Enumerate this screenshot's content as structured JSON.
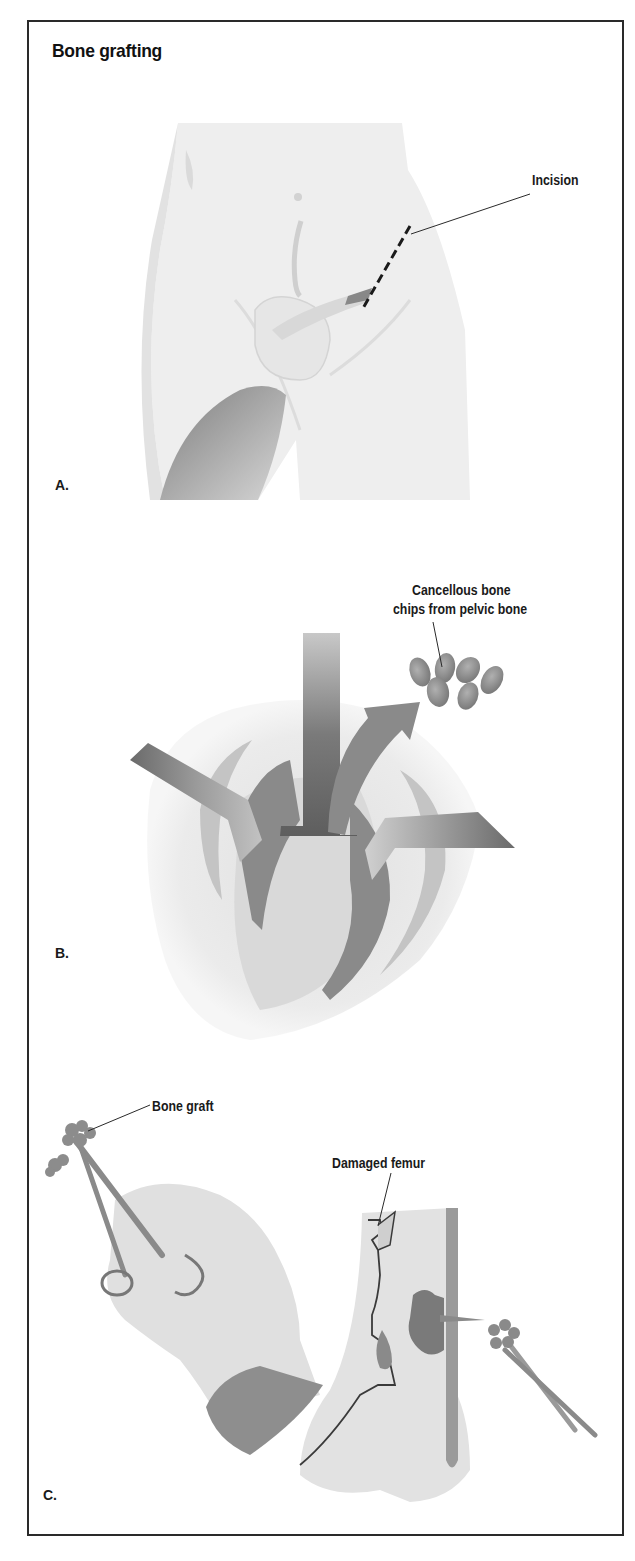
{
  "figure": {
    "title": "Bone grafting",
    "panels": [
      {
        "letter": "A.",
        "callouts": [
          {
            "text": "Incision"
          }
        ]
      },
      {
        "letter": "B.",
        "callouts": [
          {
            "line1": "Cancellous bone",
            "line2": "chips from pelvic bone"
          }
        ]
      },
      {
        "letter": "C.",
        "callouts": [
          {
            "text": "Bone graft"
          },
          {
            "text": "Damaged femur"
          }
        ]
      }
    ]
  },
  "colors": {
    "frame": "#2a2a2a",
    "text": "#1a1a1a",
    "skin": "#ececec",
    "tissue": "#8f8f8f",
    "bone_chip": "#9a9a9a"
  }
}
